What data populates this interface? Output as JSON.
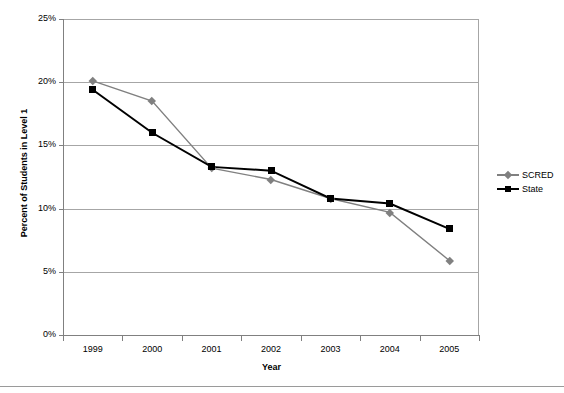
{
  "chart_data": {
    "type": "line",
    "title": "",
    "xlabel": "Year",
    "ylabel": "Percent of Students in Level 1",
    "categories": [
      "1999",
      "2000",
      "2001",
      "2002",
      "2003",
      "2004",
      "2005"
    ],
    "ylim": [
      0,
      25
    ],
    "ytick_labels": [
      "0%",
      "5%",
      "10%",
      "15%",
      "20%",
      "25%"
    ],
    "ytick_values": [
      0,
      5,
      10,
      15,
      20,
      25
    ],
    "grid": "horizontal",
    "legend_position": "right",
    "series": [
      {
        "name": "SCRED",
        "color": "#808080",
        "marker": "diamond",
        "values": [
          20.1,
          18.5,
          13.2,
          12.3,
          10.8,
          9.7,
          5.9
        ]
      },
      {
        "name": "State",
        "color": "#000000",
        "marker": "square",
        "values": [
          19.4,
          16.0,
          13.3,
          13.0,
          10.8,
          10.4,
          8.4
        ]
      }
    ]
  },
  "legend": {
    "items": [
      {
        "label": "SCRED"
      },
      {
        "label": "State"
      }
    ]
  }
}
